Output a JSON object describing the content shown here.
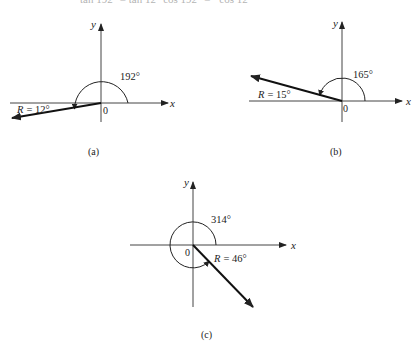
{
  "top_clipped_text": "tan 192° = tan 12°      cos 192° = −cos 12°",
  "diagrams": [
    {
      "id": "a",
      "caption": "(a)",
      "angle_label": "192°",
      "ref_label": "R = 12°",
      "ref_prefix": "R",
      "ref_value": "= 12°",
      "x_label": "x",
      "y_label": "y",
      "origin_label": "0",
      "angle_deg": 192,
      "reference_deg": 12
    },
    {
      "id": "b",
      "caption": "(b)",
      "angle_label": "165°",
      "ref_label": "R = 15°",
      "ref_prefix": "R",
      "ref_value": "= 15°",
      "x_label": "x",
      "y_label": "y",
      "origin_label": "0",
      "angle_deg": 165,
      "reference_deg": 15
    },
    {
      "id": "c",
      "caption": "(c)",
      "angle_label": "314°",
      "ref_label": "R = 46°",
      "ref_prefix": "R",
      "ref_value": "= 46°",
      "x_label": "x",
      "y_label": "y",
      "origin_label": "0",
      "angle_deg": 314,
      "reference_deg": 46
    }
  ]
}
